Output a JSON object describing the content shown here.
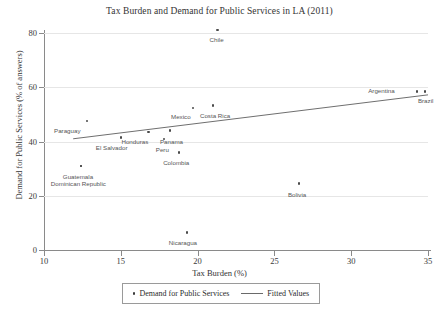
{
  "chart_data": {
    "type": "scatter",
    "title": "Tax Burden and Demand for Public Services in LA (2011)",
    "xlabel": "Tax Burden (%)",
    "ylabel": "Demand for Public Services (% of answers)",
    "xlim": [
      10,
      35
    ],
    "ylim": [
      0,
      80
    ],
    "xticks": [
      10,
      15,
      20,
      25,
      30,
      35
    ],
    "yticks": [
      0,
      20,
      40,
      60,
      80
    ],
    "grid": "horizontal",
    "legend_position": "bottom-center",
    "series": [
      {
        "name": "Demand for Public Services",
        "marker": "dot",
        "points": [
          {
            "label": "Chile",
            "x": 21.3,
            "y": 81.0,
            "label_dx": -8,
            "label_dy": 6
          },
          {
            "label": "Argentina",
            "x": 34.3,
            "y": 58.5,
            "label_dx": -49,
            "label_dy": -4
          },
          {
            "label": "Brazil",
            "x": 34.8,
            "y": 58.5,
            "label_dx": -7,
            "label_dy": 6
          },
          {
            "label": "Costa Rica",
            "x": 21.0,
            "y": 53.2,
            "label_dx": -13,
            "label_dy": 6
          },
          {
            "label": "Mexico",
            "x": 19.7,
            "y": 52.3,
            "label_dx": -22,
            "label_dy": 5
          },
          {
            "label": "Paraguay",
            "x": 12.8,
            "y": 47.5,
            "label_dx": -33,
            "label_dy": 6
          },
          {
            "label": "Honduras",
            "x": 16.8,
            "y": 43.5,
            "label_dx": -27,
            "label_dy": 6
          },
          {
            "label": "Panama",
            "x": 18.2,
            "y": 44.0,
            "label_dx": -10,
            "label_dy": 7
          },
          {
            "label": "Peru",
            "x": 17.8,
            "y": 41.0,
            "label_dx": -8,
            "label_dy": 7
          },
          {
            "label": "El Salvador",
            "x": 15.0,
            "y": 41.5,
            "label_dx": -25,
            "label_dy": 7
          },
          {
            "label": "Colombia",
            "x": 18.8,
            "y": 36.0,
            "label_dx": -16,
            "label_dy": 7
          },
          {
            "label": "Guatemala",
            "x": 12.4,
            "y": 31.0,
            "label_dx": -18,
            "label_dy": 7
          },
          {
            "label": "Dominican Republic",
            "x": 12.4,
            "y": 31.0,
            "label_dx": -30,
            "label_dy": 14
          },
          {
            "label": "Bolivia",
            "x": 26.6,
            "y": 24.5,
            "label_dx": -11,
            "label_dy": 7
          },
          {
            "label": "Nicaragua",
            "x": 19.3,
            "y": 6.5,
            "label_dx": -18,
            "label_dy": 7
          }
        ]
      },
      {
        "name": "Fitted Values",
        "type": "line",
        "x_start": 11.9,
        "y_start": 41.0,
        "x_end": 35.0,
        "y_end": 57.2
      }
    ]
  },
  "legend": {
    "scatter_label": "Demand for Public Services",
    "line_label": "Fitted Values"
  }
}
